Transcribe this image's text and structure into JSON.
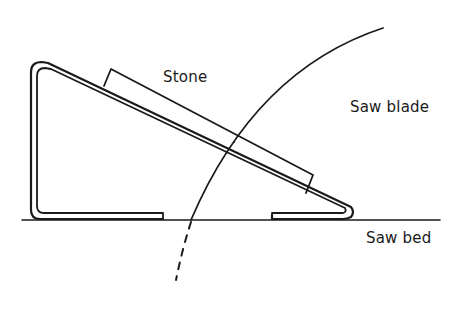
{
  "diagram": {
    "type": "technical line drawing",
    "labels": {
      "stone": "Stone",
      "saw_blade": "Saw blade",
      "saw_bed": "Saw bed"
    },
    "components": [
      {
        "name": "saw-bed",
        "label": "Saw bed"
      },
      {
        "name": "stone",
        "label": "Stone"
      },
      {
        "name": "saw-blade",
        "label": "Saw blade"
      },
      {
        "name": "angled-holder-frame",
        "label": ""
      }
    ],
    "colors": {
      "line": "#1a1a1a",
      "background": "#ffffff"
    }
  }
}
